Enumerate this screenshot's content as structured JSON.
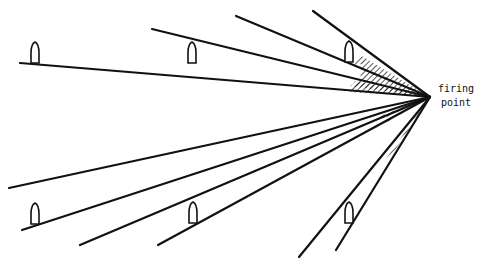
{
  "diagram": {
    "title": "",
    "firing_point": {
      "x": 430,
      "y": 97,
      "label_line1": "firing",
      "label_line2": "point"
    },
    "line_color": "#111111",
    "hatch_color": "#111111",
    "rays": [
      {
        "id": "upper-1",
        "x1": 20,
        "y1": 63
      },
      {
        "id": "upper-2",
        "x1": 152,
        "y1": 29
      },
      {
        "id": "upper-3",
        "x1": 236,
        "y1": 16
      },
      {
        "id": "upper-4",
        "x1": 313,
        "y1": 11
      },
      {
        "id": "lower-1",
        "x1": 9,
        "y1": 188
      },
      {
        "id": "lower-2",
        "x1": 22,
        "y1": 230
      },
      {
        "id": "lower-3",
        "x1": 80,
        "y1": 245
      },
      {
        "id": "lower-4",
        "x1": 158,
        "y1": 245
      },
      {
        "id": "lower-5",
        "x1": 299,
        "y1": 257
      },
      {
        "id": "lower-6",
        "x1": 336,
        "y1": 250
      }
    ],
    "bullets": [
      {
        "id": "bullet-upper-left",
        "x": 35,
        "y": 53,
        "dir": "up"
      },
      {
        "id": "bullet-upper-mid",
        "x": 192,
        "y": 53,
        "dir": "up"
      },
      {
        "id": "bullet-upper-right",
        "x": 349,
        "y": 52,
        "dir": "up"
      },
      {
        "id": "bullet-lower-left",
        "x": 35,
        "y": 214,
        "dir": "up"
      },
      {
        "id": "bullet-lower-mid",
        "x": 193,
        "y": 213,
        "dir": "up"
      },
      {
        "id": "bullet-lower-right",
        "x": 349,
        "y": 213,
        "dir": "up"
      }
    ]
  }
}
